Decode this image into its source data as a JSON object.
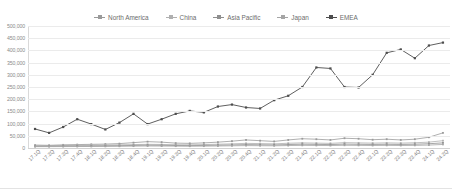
{
  "chart_title": "",
  "legend": {
    "position": "top-center",
    "entries": [
      {
        "label": "North America",
        "color": "#9a9a9a"
      },
      {
        "label": "China",
        "color": "#b0b0b0"
      },
      {
        "label": "Asia Pacific",
        "color": "#8f8f8f"
      },
      {
        "label": "Japan",
        "color": "#a5a5a5"
      },
      {
        "label": "EMEA",
        "color": "#4d4d4d"
      }
    ]
  },
  "chart_data": {
    "type": "line",
    "title": "",
    "xlabel": "",
    "ylabel": "",
    "grid": true,
    "legend_position": "top-center",
    "ylim": [
      0,
      500000
    ],
    "yticks": [
      0,
      50000,
      100000,
      150000,
      200000,
      250000,
      300000,
      350000,
      400000,
      450000,
      500000
    ],
    "ytick_labels": [
      "0",
      "50,000",
      "100,000",
      "150,000",
      "200,000",
      "250,000",
      "300,000",
      "350,000",
      "400,000",
      "450,000",
      "500,000"
    ],
    "categories": [
      "17.1Q",
      "17.2Q",
      "17.3Q",
      "17.4Q",
      "18.1Q",
      "18.2Q",
      "18.3Q",
      "18.4Q",
      "19.1Q",
      "19.2Q",
      "19.3Q",
      "19.4Q",
      "20.1Q",
      "20.2Q",
      "20.3Q",
      "20.4Q",
      "21.1Q",
      "21.2Q",
      "21.3Q",
      "21.4Q",
      "22.1Q",
      "22.2Q",
      "22.3Q",
      "22.4Q",
      "23.1Q",
      "23.2Q",
      "23.3Q",
      "23.4Q",
      "24.1Q",
      "24.2Q"
    ],
    "series": [
      {
        "name": "North America",
        "color": "#9a9a9a",
        "values": [
          12000,
          11000,
          13000,
          14000,
          15000,
          16000,
          18000,
          22000,
          26000,
          24000,
          20000,
          19000,
          21000,
          24000,
          28000,
          33000,
          30000,
          27000,
          33000,
          38000,
          36000,
          33000,
          40000,
          38000,
          34000,
          36000,
          33000,
          36000,
          44000,
          62000
        ]
      },
      {
        "name": "China",
        "color": "#b0b0b0",
        "values": [
          9000,
          9500,
          10000,
          11000,
          11500,
          12000,
          13000,
          14000,
          15000,
          14500,
          13500,
          13000,
          14000,
          15500,
          17000,
          19000,
          18000,
          17000,
          19500,
          21000,
          20000,
          19000,
          22000,
          21000,
          20000,
          21000,
          20000,
          21500,
          24000,
          30000
        ]
      },
      {
        "name": "Asia Pacific",
        "color": "#8f8f8f",
        "values": [
          7000,
          7200,
          7600,
          8000,
          8400,
          8800,
          9500,
          10500,
          11500,
          11000,
          10200,
          9800,
          10500,
          11500,
          12500,
          14000,
          13200,
          12500,
          14200,
          15500,
          14800,
          14000,
          16000,
          15200,
          14500,
          15200,
          14500,
          15500,
          17500,
          21000
        ]
      },
      {
        "name": "Japan",
        "color": "#a5a5a5",
        "values": [
          5500,
          5600,
          5800,
          6000,
          6200,
          6500,
          7000,
          7600,
          8200,
          8000,
          7500,
          7200,
          7600,
          8200,
          9000,
          9800,
          9400,
          9000,
          10000,
          10800,
          10400,
          10000,
          11200,
          10800,
          10200,
          10800,
          10200,
          10800,
          12000,
          14500
        ]
      },
      {
        "name": "EMEA",
        "color": "#4d4d4d",
        "values": [
          78000,
          62000,
          86000,
          118000,
          98000,
          76000,
          104000,
          140000,
          98000,
          118000,
          140000,
          152000,
          146000,
          170000,
          178000,
          166000,
          162000,
          196000,
          214000,
          250000,
          330000,
          326000,
          250000,
          248000,
          300000,
          390000,
          404000,
          368000,
          420000,
          432000
        ]
      }
    ]
  }
}
